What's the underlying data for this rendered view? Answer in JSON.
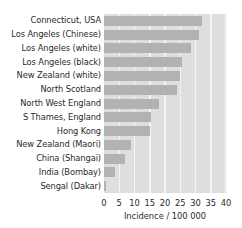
{
  "chart_data": {
    "type": "bar",
    "orientation": "horizontal",
    "title": "",
    "xlabel": "Incidence / 100 000",
    "ylabel": "",
    "xlim": [
      0,
      40
    ],
    "xticks": [
      0,
      5,
      10,
      15,
      20,
      25,
      30,
      35,
      40
    ],
    "grid": true,
    "legend": null,
    "categories": [
      "Connecticut,  USA",
      "Los Angeles (Chinese)",
      "Los Angeles (white)",
      "Los Angeles (black)",
      "New Zealand (white)",
      "North Scotland",
      "North West England",
      "S Thames, England",
      "Hong Kong",
      "New Zealand (Maori)",
      "China (Shangai)",
      "India (Bombay)",
      "Sengal (Dakar)"
    ],
    "values": [
      32,
      31,
      28.5,
      25.5,
      25,
      24,
      18,
      15.5,
      15,
      9,
      7,
      3.5,
      0.5
    ]
  },
  "colors": {
    "background": "#dedede",
    "bar": "#b2b2b2",
    "grid": "#f4f4f4"
  }
}
